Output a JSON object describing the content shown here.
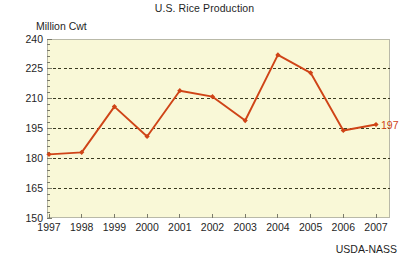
{
  "chart_data": {
    "type": "line",
    "title": "U.S. Rice Production",
    "xlabel": "",
    "ylabel": "Million Cwt",
    "categories": [
      "1997",
      "1998",
      "1999",
      "2000",
      "2001",
      "2002",
      "2003",
      "2004",
      "2005",
      "2006",
      "2007"
    ],
    "values": [
      182,
      183,
      206,
      191,
      214,
      211,
      199,
      232,
      223,
      194,
      197
    ],
    "series": [
      {
        "name": "U.S. Rice Production",
        "values": [
          182,
          183,
          206,
          191,
          214,
          211,
          199,
          232,
          223,
          194,
          197
        ]
      }
    ],
    "ylim": [
      150,
      240
    ],
    "yticks": [
      150,
      165,
      180,
      195,
      210,
      225,
      240
    ],
    "ytick_labels": [
      "150",
      "165",
      "180",
      "195",
      "210",
      "225",
      "240"
    ],
    "grid": true,
    "gridlines_at": [
      165,
      180,
      195,
      210,
      225
    ],
    "legend": "none",
    "annotations": [
      {
        "label": "197",
        "x": "2007",
        "y": 197
      }
    ],
    "source": "USDA-NASS",
    "colors": {
      "line": "#cf4417",
      "marker": "#cf4417",
      "plot_background": "#f9f8d7",
      "grid": "#3a3a20",
      "axis": "#7a7a6a",
      "text": "#1f1f1f",
      "annotation": "#cf4417"
    }
  }
}
